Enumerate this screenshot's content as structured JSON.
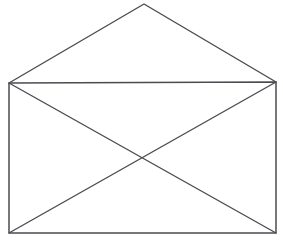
{
  "figure": {
    "name": "envelope-line-drawing",
    "title": "Envelope",
    "background_color": "#ffffff",
    "stroke_color": "#4b4b52",
    "stroke_width": 1.4,
    "canvas": {
      "width": 283,
      "height": 244
    },
    "vertices": {
      "top_left": {
        "label": "top-left",
        "x": 9,
        "y": 83
      },
      "top_right": {
        "label": "top-right",
        "x": 276,
        "y": 82
      },
      "bottom_left": {
        "label": "bottom-left",
        "x": 9,
        "y": 233
      },
      "bottom_right": {
        "label": "bottom-right",
        "x": 276,
        "y": 233
      },
      "flap_apex": {
        "label": "flap-apex",
        "x": 144,
        "y": 4
      },
      "diagonal_crossing": {
        "label": "diagonal-crossing",
        "x": 142,
        "y": 157
      }
    },
    "segments": [
      {
        "name": "body-top-edge",
        "from": "top_left",
        "to": "top_right"
      },
      {
        "name": "body-right-edge",
        "from": "top_right",
        "to": "bottom_right"
      },
      {
        "name": "body-bottom-edge",
        "from": "bottom_right",
        "to": "bottom_left"
      },
      {
        "name": "body-left-edge",
        "from": "bottom_left",
        "to": "top_left"
      },
      {
        "name": "diagonal-tl-br",
        "from": "top_left",
        "to": "bottom_right"
      },
      {
        "name": "diagonal-tr-bl",
        "from": "top_right",
        "to": "bottom_left"
      },
      {
        "name": "flap-left-edge",
        "from": "top_left",
        "to": "flap_apex"
      },
      {
        "name": "flap-right-edge",
        "from": "flap_apex",
        "to": "top_right"
      }
    ],
    "paths": {
      "body_rect": "M 9 83 L 276 82 L 276 233 L 9 233 Z",
      "diagonal_tl_br": "M 9 83 L 276 233",
      "diagonal_tr_bl": "M 276 82 L 9 233",
      "flap": "M 9 83 L 144 4 L 276 82"
    }
  }
}
